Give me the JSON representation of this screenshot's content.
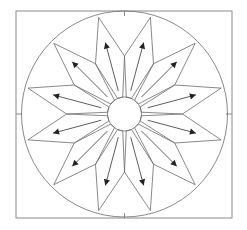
{
  "diagram": {
    "type": "mariners-compass-quilt-block",
    "point_count": 12,
    "colors": {
      "line": "#6b6b6b",
      "frame": "#8a8a8a",
      "arrow": "#222222",
      "background": "#ffffff"
    },
    "frame": {
      "x": 16,
      "y": 11,
      "width": 216,
      "height": 207
    },
    "center": {
      "x": 124.5,
      "y": 114
    },
    "outer_circle_radius": 103,
    "inner_circle_radius": 17,
    "kite": {
      "tip_radius": 100,
      "shoulder_radius": 58,
      "base_radius": 17,
      "base_half_angle_deg": 9,
      "start_angle_deg": 15,
      "step_deg": 30
    },
    "arrows": {
      "from_radius": 24,
      "to_radius": 74,
      "direction": "outward"
    },
    "tick_marks": [
      "top",
      "bottom",
      "left",
      "right"
    ]
  }
}
